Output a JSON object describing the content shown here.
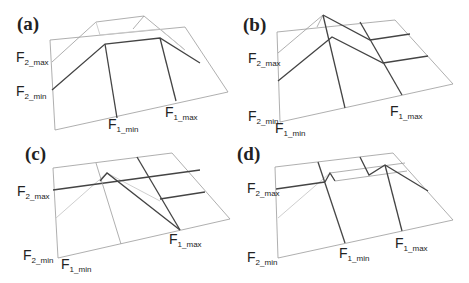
{
  "figure": {
    "panels": [
      {
        "id": "a",
        "label": "(a)",
        "f2_max": "F",
        "f2_max_sub": "2_max",
        "f2_min": "F",
        "f2_min_sub": "2_min",
        "f1_min": "F",
        "f1_min_sub": "1_min",
        "f1_max": "F",
        "f1_max_sub": "1_max"
      },
      {
        "id": "b",
        "label": "(b)",
        "f2_max": "F",
        "f2_max_sub": "2_max",
        "f2_min": "F",
        "f2_min_sub": "2_min",
        "f1_min": "F",
        "f1_min_sub": "1_min",
        "f1_max": "F",
        "f1_max_sub": "1_max"
      },
      {
        "id": "c",
        "label": "(c)",
        "f2_max": "F",
        "f2_max_sub": "2_max",
        "f2_min": "F",
        "f2_min_sub": "2_min",
        "f1_min": "F",
        "f1_min_sub": "1_min",
        "f1_max": "F",
        "f1_max_sub": "1_max"
      },
      {
        "id": "d",
        "label": "(d)",
        "f2_max": "F",
        "f2_max_sub": "2_max",
        "f2_min": "F",
        "f2_min_sub": "2_min",
        "f1_min": "F",
        "f1_min_sub": "1_min",
        "f1_max": "F",
        "f1_max_sub": "1_max"
      }
    ]
  }
}
